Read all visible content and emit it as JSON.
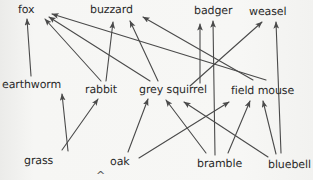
{
  "diagram": {
    "type": "food-web",
    "background_color": "#f4f4f2",
    "line_color": "#4a4a4a",
    "text_color": "#2a2a2a",
    "nodes": [
      {
        "id": "fox",
        "label": "fox",
        "x": 18,
        "y": 4,
        "trophic": "predator"
      },
      {
        "id": "buzzard",
        "label": "buzzard",
        "x": 90,
        "y": 4,
        "trophic": "predator"
      },
      {
        "id": "badger",
        "label": "badger",
        "x": 194,
        "y": 5,
        "trophic": "predator"
      },
      {
        "id": "weasel",
        "label": "weasel",
        "x": 249,
        "y": 6,
        "trophic": "predator"
      },
      {
        "id": "earthworm",
        "label": "earthworm",
        "x": 2,
        "y": 79,
        "trophic": "consumer"
      },
      {
        "id": "rabbit",
        "label": "rabbit",
        "x": 85,
        "y": 84,
        "trophic": "consumer"
      },
      {
        "id": "grey_squirrel",
        "label": "grey squirrel",
        "x": 139,
        "y": 84,
        "trophic": "consumer"
      },
      {
        "id": "field_mouse",
        "label": "field mouse",
        "x": 231,
        "y": 85,
        "trophic": "consumer"
      },
      {
        "id": "grass",
        "label": "grass",
        "x": 24,
        "y": 155,
        "trophic": "producer"
      },
      {
        "id": "oak",
        "label": "oak",
        "x": 110,
        "y": 156,
        "trophic": "producer"
      },
      {
        "id": "bramble",
        "label": "bramble",
        "x": 197,
        "y": 158,
        "trophic": "producer"
      },
      {
        "id": "bluebell",
        "label": "bluebell",
        "x": 268,
        "y": 159,
        "trophic": "producer"
      }
    ],
    "edges": [
      {
        "from": "grass",
        "to": "earthworm",
        "x1": 68,
        "y1": 151,
        "x2": 62,
        "y2": 94
      },
      {
        "from": "grass",
        "to": "rabbit",
        "x1": 62,
        "y1": 150,
        "x2": 98,
        "y2": 99
      },
      {
        "from": "earthworm",
        "to": "fox",
        "x1": 31,
        "y1": 76,
        "x2": 27,
        "y2": 19
      },
      {
        "from": "rabbit",
        "to": "fox",
        "x1": 101,
        "y1": 81,
        "x2": 45,
        "y2": 19
      },
      {
        "from": "grey_squirrel",
        "to": "fox",
        "x1": 150,
        "y1": 81,
        "x2": 49,
        "y2": 17
      },
      {
        "from": "field_mouse",
        "to": "fox",
        "x1": 266,
        "y1": 80,
        "x2": 52,
        "y2": 14
      },
      {
        "from": "rabbit",
        "to": "buzzard",
        "x1": 106,
        "y1": 81,
        "x2": 113,
        "y2": 22
      },
      {
        "from": "grey_squirrel",
        "to": "buzzard",
        "x1": 158,
        "y1": 81,
        "x2": 130,
        "y2": 21
      },
      {
        "from": "field_mouse",
        "to": "buzzard",
        "x1": 253,
        "y1": 80,
        "x2": 143,
        "y2": 17
      },
      {
        "from": "bramble",
        "to": "badger",
        "x1": 215,
        "y1": 155,
        "x2": 213,
        "y2": 21
      },
      {
        "from": "grey_squirrel",
        "to": "badger",
        "x1": 200,
        "y1": 83,
        "x2": 200,
        "y2": 24
      },
      {
        "from": "field_mouse",
        "to": "weasel",
        "x1": 190,
        "y1": 86,
        "x2": 262,
        "y2": 22
      },
      {
        "from": "bluebell",
        "to": "weasel",
        "x1": 281,
        "y1": 153,
        "x2": 276,
        "y2": 22
      },
      {
        "from": "oak",
        "to": "grey_squirrel",
        "x1": 128,
        "y1": 152,
        "x2": 148,
        "y2": 99
      },
      {
        "from": "bramble",
        "to": "grey_squirrel",
        "x1": 206,
        "y1": 153,
        "x2": 166,
        "y2": 100
      },
      {
        "from": "oak",
        "to": "field_mouse",
        "x1": 139,
        "y1": 158,
        "x2": 229,
        "y2": 102
      },
      {
        "from": "bramble",
        "to": "field_mouse",
        "x1": 228,
        "y1": 153,
        "x2": 250,
        "y2": 101
      },
      {
        "from": "bluebell",
        "to": "field_mouse",
        "x1": 276,
        "y1": 154,
        "x2": 263,
        "y2": 101
      },
      {
        "from": "bluebell",
        "to": "grey_squirrel",
        "x1": 268,
        "y1": 157,
        "x2": 184,
        "y2": 102
      }
    ],
    "caret_mark": "^"
  }
}
